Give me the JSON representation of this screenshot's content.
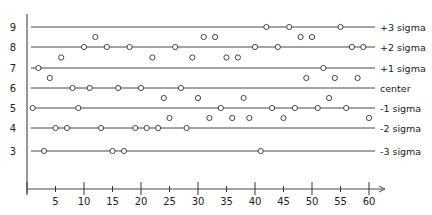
{
  "chart_data": {
    "type": "scatter",
    "title": "",
    "xlabel": "",
    "ylabel": "",
    "xlim": [
      0,
      62
    ],
    "ylim": [
      2,
      10
    ],
    "x_ticks_major": [
      10,
      20,
      30,
      40,
      50,
      60
    ],
    "x_ticks_minor": [
      5,
      15,
      25,
      35,
      45,
      55
    ],
    "x_tick_labels": [
      "5",
      "10",
      "15",
      "20",
      "25",
      "30",
      "35",
      "40",
      "45",
      "50",
      "55",
      "60"
    ],
    "y_tick_labels": [
      "3",
      "4",
      "5",
      "6",
      "7",
      "8",
      "9"
    ],
    "control_lines": [
      {
        "y": 9,
        "label": "+3 sigma"
      },
      {
        "y": 8,
        "label": "+2 sigma"
      },
      {
        "y": 7,
        "label": "+1 sigma"
      },
      {
        "y": 6,
        "label": "center"
      },
      {
        "y": 5,
        "label": "-1 sigma"
      },
      {
        "y": 4,
        "label": "-2 sigma"
      },
      {
        "y": 3,
        "label": "-3 sigma"
      }
    ],
    "x": [
      1,
      2,
      3,
      4,
      5,
      6,
      7,
      8,
      9,
      10,
      11,
      12,
      13,
      14,
      15,
      16,
      17,
      18,
      19,
      20,
      21,
      22,
      23,
      24,
      25,
      26,
      27,
      28,
      29,
      30,
      31,
      32,
      33,
      34,
      35,
      36,
      37,
      38,
      39,
      40,
      41,
      42,
      43,
      44,
      45,
      46,
      47,
      48,
      49,
      50,
      51,
      52,
      53,
      54,
      55,
      56,
      57,
      58,
      59,
      60
    ],
    "values": [
      5,
      7,
      3,
      6.5,
      4,
      7.5,
      4,
      6,
      5,
      8,
      6,
      8.5,
      4,
      8,
      3,
      6,
      3,
      8,
      4,
      6,
      4,
      7.5,
      4,
      5.5,
      4.5,
      8,
      6,
      4,
      7.5,
      5.5,
      8.5,
      4.5,
      8.5,
      5,
      7.5,
      4.5,
      7.5,
      5.5,
      4.5,
      8,
      3,
      9,
      5,
      8,
      4.5,
      9,
      5,
      8.5,
      6.5,
      8.5,
      5,
      7,
      5.5,
      6.5,
      9,
      5,
      8,
      6.5,
      8,
      4.5
    ],
    "axis_arrow": "-->",
    "grid": false,
    "marker": "open-circle"
  }
}
